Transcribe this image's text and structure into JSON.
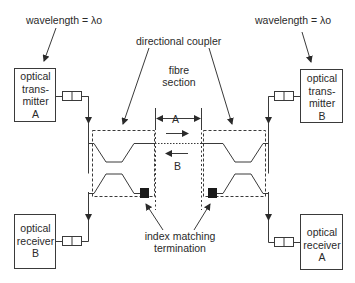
{
  "diagram": {
    "labels": {
      "wavelength_left": "wavelength = λo",
      "wavelength_right": "wavelength = λo",
      "directional_coupler": "directional coupler",
      "fibre_section_line1": "fibre",
      "fibre_section_line2": "section",
      "direction_a": "A",
      "direction_b": "B",
      "index_matching_line1": "index matching",
      "index_matching_line2": "termination"
    },
    "blocks": {
      "tx_a": {
        "line1": "optical",
        "line2": "trans-",
        "line3": "mitter",
        "line4": "A"
      },
      "tx_b": {
        "line1": "optical",
        "line2": "trans-",
        "line3": "mitter",
        "line4": "B"
      },
      "rx_b": {
        "line1": "optical",
        "line2": "receiver",
        "line3": "B"
      },
      "rx_a": {
        "line1": "optical",
        "line2": "receiver",
        "line3": "A"
      }
    },
    "colors": {
      "line": "#3a3a3a",
      "text": "#2a2a2a",
      "termination": "#1a1a1a"
    }
  }
}
